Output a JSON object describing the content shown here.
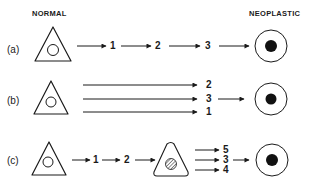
{
  "headers": {
    "left": "NORMAL",
    "right": "NEOPLASTIC"
  },
  "rows": [
    {
      "label": "(a)",
      "description": "Sequential pathway: normal cell -> 1 -> 2 -> 3 -> neoplastic cell",
      "steps": [
        "1",
        "2",
        "3"
      ]
    },
    {
      "label": "(b)",
      "description": "Parallel pathways from normal cell to events 2, 3, 1, then 3 -> neoplastic cell",
      "branches": [
        "2",
        "3",
        "1"
      ],
      "converging_step": "3"
    },
    {
      "label": "(c)",
      "description": "Normal cell -> 1 -> 2 -> intermediate (preneoplastic) cell with hatched nucleus -> branches 5, 3, 4 -> 3 -> neoplastic cell",
      "steps": [
        "1",
        "2"
      ],
      "branches": [
        "5",
        "3",
        "4"
      ]
    }
  ],
  "legend": {
    "normal_cell_shape": "triangle with open circle nucleus",
    "intermediate_cell_shape": "triangle with hatched nucleus",
    "neoplastic_cell_shape": "circle with solid black nucleus"
  },
  "colors": {
    "line": "#1a1a1a",
    "background": "#ffffff"
  }
}
